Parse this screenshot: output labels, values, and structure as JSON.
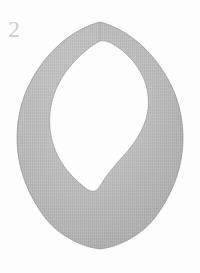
{
  "figure": {
    "number_label": "2",
    "caption": "",
    "subject_name": "knit collar bib garment piece",
    "background_color": "#fdfdfd",
    "label_color": "#cfcfcf"
  },
  "garment": {
    "name": "collar",
    "shape_description": "teardrop / leaf shaped bib collar with inner neckline opening and pointed bottom",
    "fabric_texture": "fine vertical knit ribbing",
    "fabric_color_mid": "#adadad",
    "fabric_color_light": "#bdbdbd",
    "fabric_color_dark": "#9b9b9b",
    "edge_color": "#8e8e8e",
    "outer_top_notch_x": 100,
    "outer_top_y": 22,
    "outer_left_x": 15,
    "outer_right_x": 184,
    "outer_bottom_y": 249,
    "inner_top_y": 40,
    "inner_left_x": 48,
    "inner_right_x": 151,
    "inner_bottom_y": 186
  },
  "palette": {
    "white": "#ffffff",
    "off_white": "#fdfdfd",
    "gray_fabric": "#adadad",
    "gray_label": "#cfcfcf"
  }
}
